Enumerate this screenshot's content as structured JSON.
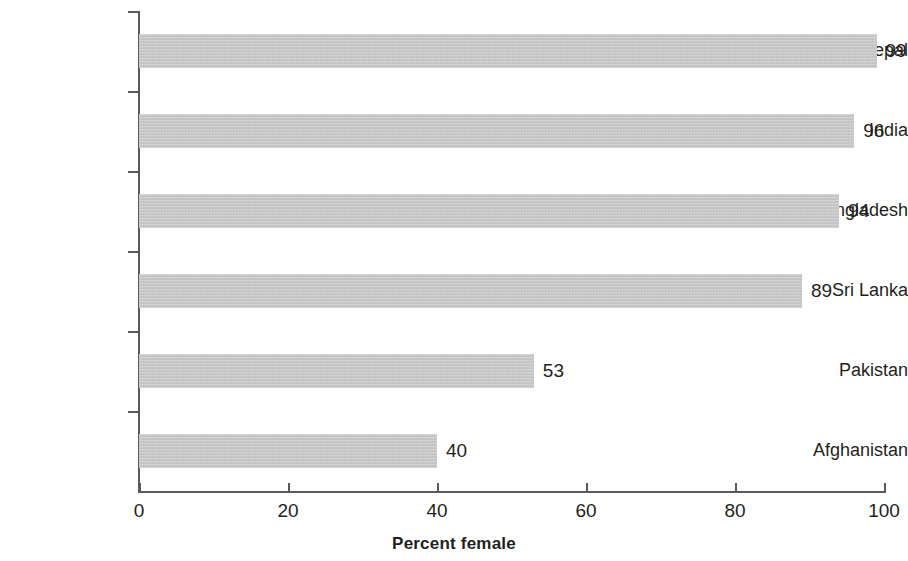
{
  "chart_data": {
    "type": "bar",
    "orientation": "horizontal",
    "title": "",
    "subtitle": "",
    "xlabel": "Percent female",
    "ylabel": "",
    "categories": [
      "Nepal",
      "India",
      "Bangladesh",
      "Sri Lanka",
      "Pakistan",
      "Afghanistan"
    ],
    "values": [
      99,
      96,
      94,
      89,
      53,
      40
    ],
    "value_labels": [
      "99",
      "96",
      "94",
      "89",
      "53",
      "40"
    ],
    "xlim": [
      0,
      100
    ],
    "xticks": [
      0,
      20,
      40,
      60,
      80,
      100
    ],
    "xtick_labels": [
      "0",
      "20",
      "40",
      "60",
      "80",
      "100"
    ],
    "grid": false,
    "legend": null,
    "series": [
      {
        "name": "Percent female",
        "values": [
          99,
          96,
          94,
          89,
          53,
          40
        ]
      }
    ],
    "bar_color": "#c6c6c6",
    "axis_color": "#5a5a5a",
    "text_color": "#231f20",
    "background_color": "#ffffff"
  }
}
